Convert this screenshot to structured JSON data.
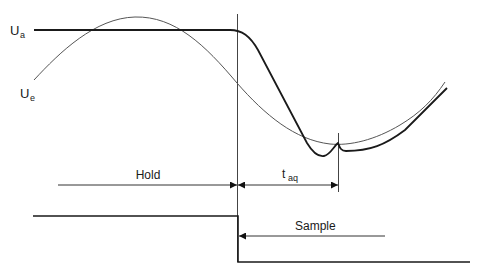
{
  "diagram": {
    "signals": {
      "output": {
        "label_main": "U",
        "label_sub": "a"
      },
      "input": {
        "label_main": "U",
        "label_sub": "e"
      }
    },
    "intervals": {
      "hold": "Hold",
      "acquisition": {
        "label_main": "t",
        "label_sub": "aq"
      },
      "sample": "Sample"
    },
    "colors": {
      "stroke": "#1a1a1a",
      "thin_stroke": "#555555",
      "background": "#ffffff"
    }
  }
}
